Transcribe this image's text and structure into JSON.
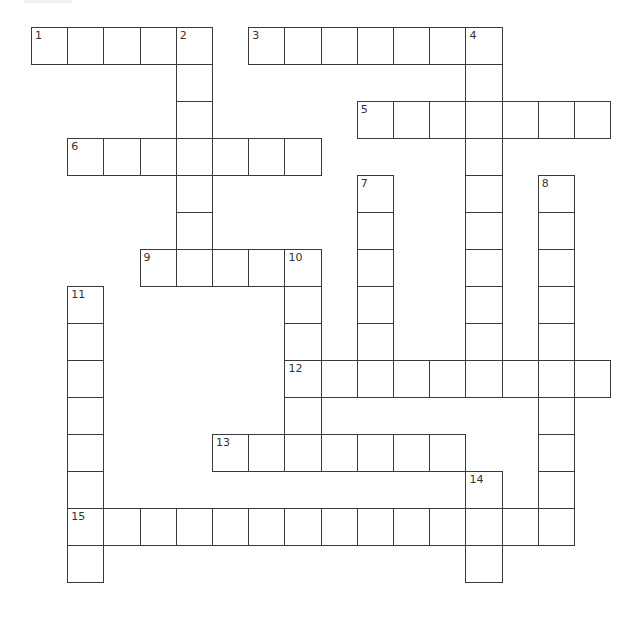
{
  "puzzle": {
    "type": "crossword",
    "grid": {
      "origin_x": 31,
      "origin_y": 27,
      "cell_w": 36.2,
      "cell_h": 37.0,
      "cols": 16,
      "rows": 15
    },
    "entries": [
      {
        "number": 1,
        "direction": "across",
        "row": 0,
        "col": 0,
        "length": 5
      },
      {
        "number": 2,
        "direction": "down",
        "row": 0,
        "col": 4,
        "length": 7
      },
      {
        "number": 3,
        "direction": "across",
        "row": 0,
        "col": 6,
        "length": 7
      },
      {
        "number": 4,
        "direction": "down",
        "row": 0,
        "col": 12,
        "length": 10
      },
      {
        "number": 5,
        "direction": "across",
        "row": 2,
        "col": 9,
        "length": 7
      },
      {
        "number": 6,
        "direction": "across",
        "row": 3,
        "col": 1,
        "length": 7
      },
      {
        "number": 7,
        "direction": "down",
        "row": 4,
        "col": 9,
        "length": 6
      },
      {
        "number": 8,
        "direction": "down",
        "row": 4,
        "col": 14,
        "length": 10
      },
      {
        "number": 9,
        "direction": "across",
        "row": 6,
        "col": 3,
        "length": 5
      },
      {
        "number": 10,
        "direction": "down",
        "row": 6,
        "col": 7,
        "length": 5
      },
      {
        "number": 11,
        "direction": "down",
        "row": 7,
        "col": 1,
        "length": 8
      },
      {
        "number": 12,
        "direction": "across",
        "row": 9,
        "col": 7,
        "length": 9
      },
      {
        "number": 13,
        "direction": "across",
        "row": 11,
        "col": 5,
        "length": 7
      },
      {
        "number": 14,
        "direction": "down",
        "row": 12,
        "col": 12,
        "length": 3
      },
      {
        "number": 15,
        "direction": "across",
        "row": 13,
        "col": 1,
        "length": 14
      }
    ],
    "colors": {
      "cell_border": "#3a3a3a",
      "cell_fill": "#ffffff",
      "number_text": "#333333",
      "background": "#ffffff"
    }
  }
}
